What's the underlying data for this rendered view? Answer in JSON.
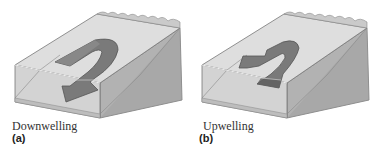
{
  "figure": {
    "panels": [
      {
        "id": "a",
        "label": "(a)",
        "caption": "Downwelling",
        "arrow_direction": "down"
      },
      {
        "id": "b",
        "label": "(b)",
        "caption": "Upwelling",
        "arrow_direction": "up"
      }
    ],
    "colors": {
      "block_top": "#d9d9d9",
      "block_front": "#cfcfcf",
      "block_side": "#a9a9a9",
      "arrow_fill": "#7d7d7d",
      "arrow_dark": "#5f5f5f",
      "outline": "#6e6e6e"
    }
  }
}
